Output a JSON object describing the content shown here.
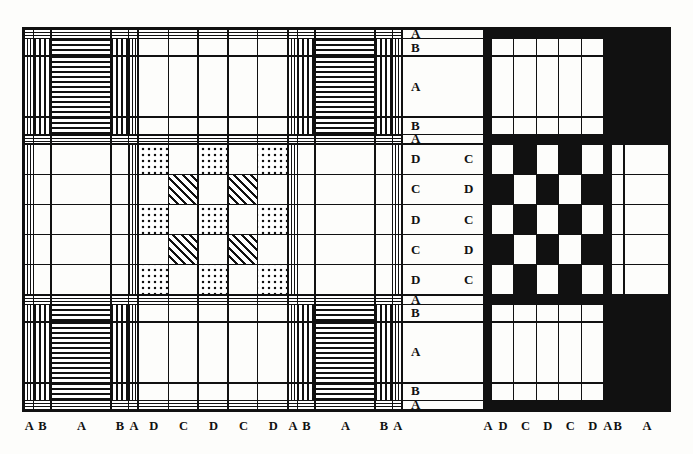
{
  "figure": {
    "type": "weaving-draft-diagram",
    "panels": [
      "left-pattern-panel",
      "right-pattern-panel"
    ],
    "colors": {
      "ink": "#111111",
      "paper": "#ffffff",
      "background": "#fdfdfb"
    }
  },
  "grid": {
    "sequence": [
      "A",
      "B",
      "A",
      "B",
      "A",
      "D",
      "C",
      "D",
      "C",
      "D",
      "A",
      "B",
      "A",
      "B",
      "A"
    ],
    "band_sizes": [
      8,
      14,
      46,
      14,
      8,
      22,
      22,
      22,
      22,
      22,
      8,
      14,
      46,
      14,
      8
    ],
    "unit_labels": {
      "A": "A",
      "B": "B",
      "C": "C",
      "D": "D"
    }
  },
  "left_panel": {
    "name": "left-pattern-panel",
    "x_axis_labels": [
      "A",
      "B",
      "A",
      "B",
      "A",
      "D",
      "C",
      "D",
      "C",
      "D",
      "A",
      "B",
      "A",
      "B",
      "A"
    ],
    "fills": {
      "A_band": "fine-stripe",
      "B_band": "stripe",
      "A_wide": "stripe",
      "C_D_center": "dots-and-diagonal-checker",
      "plain": "white"
    },
    "center_motif": {
      "rows": [
        "D",
        "C",
        "D",
        "C",
        "D"
      ],
      "cols": [
        "D",
        "C",
        "D",
        "C",
        "D"
      ],
      "cells": [
        [
          "dots",
          "white",
          "dots",
          "white",
          "dots"
        ],
        [
          "white",
          "diag",
          "white",
          "diag",
          "white"
        ],
        [
          "dots",
          "white",
          "dots",
          "white",
          "dots"
        ],
        [
          "white",
          "diag",
          "white",
          "diag",
          "white"
        ],
        [
          "dots",
          "white",
          "dots",
          "white",
          "dots"
        ]
      ]
    }
  },
  "right_panel": {
    "name": "right-pattern-panel",
    "x_axis_labels": [
      "A",
      "D",
      "C",
      "D",
      "C",
      "D",
      "A",
      "B",
      "A"
    ],
    "y_axis_labels": [
      "A",
      "B",
      "A",
      "B",
      "A",
      "D",
      "C",
      "D",
      "C",
      "D",
      "A",
      "B",
      "A",
      "B",
      "A"
    ],
    "fills": {
      "solid": "black",
      "plain": "white"
    },
    "center_motif": {
      "rows": [
        "D",
        "C",
        "D",
        "C",
        "D"
      ],
      "cols": [
        "D",
        "C",
        "D",
        "C",
        "D"
      ],
      "cells": [
        [
          "white",
          "black",
          "white",
          "black",
          "white"
        ],
        [
          "black",
          "white",
          "black",
          "white",
          "black"
        ],
        [
          "white",
          "black",
          "white",
          "black",
          "white"
        ],
        [
          "black",
          "white",
          "black",
          "white",
          "black"
        ],
        [
          "white",
          "black",
          "white",
          "black",
          "white"
        ]
      ]
    }
  },
  "row_labels": {
    "left_column": [
      "A",
      "B",
      "A",
      "B",
      "A",
      "D",
      "C",
      "D",
      "C",
      "D",
      "A",
      "B",
      "A",
      "B",
      "A"
    ],
    "inner_right_column": [
      "",
      "",
      "",
      "",
      "",
      "C",
      "D",
      "C",
      "D",
      "C",
      "",
      "",
      "",
      "",
      ""
    ]
  },
  "axis_labels": {
    "bottom_left": [
      "A",
      "B",
      "A",
      "B",
      "A",
      "D",
      "C",
      "D",
      "C",
      "D",
      "A",
      "B",
      "A",
      "B",
      "A"
    ],
    "bottom_right": [
      "A",
      "D",
      "C",
      "D",
      "C",
      "D",
      "A",
      "B",
      "A"
    ]
  }
}
